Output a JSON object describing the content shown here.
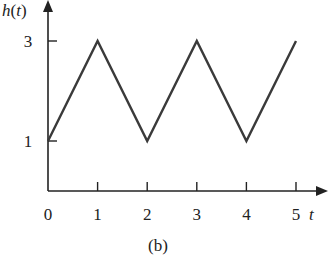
{
  "chart_data": {
    "type": "line",
    "title": "",
    "xlabel": "t",
    "ylabel": "h(t)",
    "x": [
      0,
      1,
      2,
      3,
      4,
      5
    ],
    "series": [
      {
        "name": "h(t)",
        "values": [
          1,
          3,
          1,
          3,
          1,
          3
        ]
      }
    ],
    "xticks": [
      "0",
      "1",
      "2",
      "3",
      "4",
      "5"
    ],
    "yticks": [
      "1",
      "3"
    ],
    "xlim": [
      0,
      5.6
    ],
    "ylim": [
      0,
      3.5
    ],
    "grid": false,
    "line_color": "#3a3a3a",
    "caption": "(b)"
  }
}
